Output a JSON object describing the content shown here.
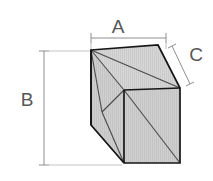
{
  "diagram": {
    "type": "isometric-box-measurement",
    "labels": {
      "width": "A",
      "height": "B",
      "depth": "C"
    },
    "colors": {
      "face_fill": "#c9c9c9",
      "face_fill_light": "#d2d2d2",
      "edge": "#1a1a1a",
      "mesh_line": "#3a3a3a",
      "dimension_line": "#8c8c8c",
      "label_text": "#575757",
      "background": "#ffffff"
    },
    "geometry": {
      "front_top_left": [
        91,
        50
      ],
      "front_bottom_left": [
        91,
        125
      ],
      "center_vertex": [
        124,
        90
      ],
      "top_back": [
        158,
        45
      ],
      "right_back_top": [
        180,
        88
      ],
      "right_back_bottom": [
        180,
        163
      ],
      "front_bottom_center": [
        124,
        163
      ]
    },
    "dimension_lines": {
      "a_line": {
        "from": [
          91,
          38
        ],
        "to": [
          166,
          38
        ],
        "orientation": "horizontal"
      },
      "b_line": {
        "from": [
          44,
          51
        ],
        "to": [
          44,
          165
        ],
        "orientation": "vertical"
      },
      "c_line": {
        "from": [
          172,
          46
        ],
        "to": [
          190,
          84
        ],
        "orientation": "diagonal"
      }
    }
  }
}
